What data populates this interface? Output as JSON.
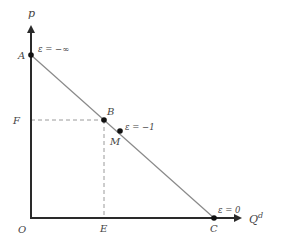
{
  "diagram": {
    "type": "linear demand curve with elasticity",
    "colors": {
      "axis": "#2a2a2a",
      "curve": "#8a8a8a",
      "dashed": "#9a9a9a",
      "point": "#111111",
      "text": "#444444"
    },
    "axes": {
      "y_label": "p",
      "x_label": "Q",
      "x_label_sup": "d",
      "origin_label": "O"
    },
    "points": {
      "A": {
        "label": "A",
        "elasticity": "ε = −∞"
      },
      "B": {
        "label": "B"
      },
      "M": {
        "label": "M",
        "elasticity": "ε = −1"
      },
      "C": {
        "label": "C",
        "elasticity": "ε = 0"
      }
    },
    "guides": {
      "F": "F",
      "E": "E"
    }
  }
}
